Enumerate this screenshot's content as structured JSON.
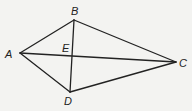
{
  "diagram": {
    "type": "geometry-quadrilateral",
    "stroke_color": "#222222",
    "background": "#f3f3f1",
    "points": {
      "A": {
        "label": "A",
        "x": 20,
        "y": 53,
        "lx": 5,
        "ly": 58
      },
      "B": {
        "label": "B",
        "x": 74,
        "y": 20,
        "lx": 71,
        "ly": 15
      },
      "C": {
        "label": "C",
        "x": 176,
        "y": 62,
        "lx": 179,
        "ly": 67
      },
      "D": {
        "label": "D",
        "x": 70,
        "y": 92,
        "lx": 64,
        "ly": 105
      },
      "E": {
        "label": "E",
        "x": 72,
        "y": 56,
        "lx": 62,
        "ly": 52
      }
    },
    "segments": [
      {
        "id": "AB",
        "from": "A",
        "to": "B"
      },
      {
        "id": "BC",
        "from": "B",
        "to": "C"
      },
      {
        "id": "CD",
        "from": "C",
        "to": "D"
      },
      {
        "id": "DA",
        "from": "D",
        "to": "A"
      },
      {
        "id": "AC",
        "from": "A",
        "to": "C"
      },
      {
        "id": "BD",
        "from": "B",
        "to": "D"
      }
    ]
  }
}
